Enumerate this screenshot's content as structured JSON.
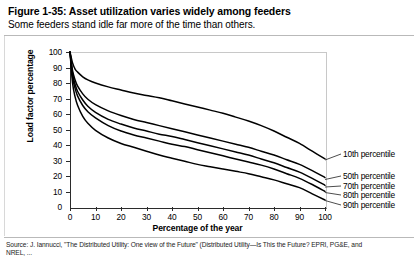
{
  "header": {
    "title": "Figure 1-35: Asset utilization varies widely among feeders",
    "subtitle": "Some feeders stand idle far more of the time than others."
  },
  "source": {
    "line1": "Source: J. Iannucci, \"The Distributed Utility: One view of the Future\" (Distributed Utility—Is This the Future? EPRI, PG&E, and",
    "line2": "NREL, ..."
  },
  "chart_data": {
    "type": "line",
    "title": "Asset utilization varies widely among feeders",
    "xlabel": "Percentage of the year",
    "ylabel": "Load factor percentage",
    "xlim": [
      0,
      100
    ],
    "ylim": [
      0,
      100
    ],
    "xticks": [
      0,
      10,
      20,
      30,
      40,
      50,
      60,
      70,
      80,
      90,
      100
    ],
    "yticks": [
      0,
      10,
      20,
      30,
      40,
      50,
      60,
      70,
      80,
      90,
      100
    ],
    "grid": false,
    "legend_position": "right-inline-leader-labels",
    "x": [
      0,
      1,
      2,
      3,
      5,
      7,
      10,
      15,
      20,
      25,
      30,
      35,
      40,
      45,
      50,
      55,
      60,
      65,
      70,
      75,
      80,
      85,
      90,
      95,
      100
    ],
    "series": [
      {
        "name": "10th percentile",
        "values": [
          100,
          93,
          89,
          87,
          84,
          82,
          80,
          77.5,
          75.5,
          73.5,
          72,
          70.5,
          68.5,
          66.5,
          64.5,
          62.5,
          60.5,
          58,
          55.5,
          52.5,
          49,
          45,
          41,
          36,
          31
        ]
      },
      {
        "name": "50th percentile",
        "values": [
          100,
          88,
          82,
          78,
          73,
          69.5,
          66,
          62,
          59,
          56.5,
          54.5,
          52.5,
          50.5,
          48.5,
          46.5,
          44.5,
          42.5,
          40.5,
          38.5,
          36,
          33.5,
          30.5,
          27.5,
          23.5,
          19
        ]
      },
      {
        "name": "70th percentile",
        "values": [
          100,
          86,
          79,
          74.5,
          69,
          65,
          61,
          56.5,
          53.5,
          51,
          49,
          47,
          45.5,
          43.5,
          41.5,
          39.5,
          37.5,
          35.5,
          33.5,
          31,
          28.5,
          25.5,
          22.5,
          18.5,
          14
        ]
      },
      {
        "name": "80th percentile",
        "values": [
          100,
          84,
          76.5,
          71.5,
          65.5,
          61.5,
          57.5,
          52.5,
          49,
          46.5,
          44.5,
          42.5,
          40.5,
          39,
          37,
          35,
          33,
          31,
          29,
          27,
          24.5,
          21.5,
          18.5,
          14.5,
          10
        ]
      },
      {
        "name": "90th percentile",
        "values": [
          100,
          80,
          71,
          65.5,
          58.5,
          54,
          49.5,
          44.5,
          41,
          38.5,
          36,
          33.5,
          31.5,
          29.5,
          27.5,
          26,
          24.5,
          23,
          21.5,
          19.5,
          17.5,
          15,
          12.5,
          8.5,
          4.5
        ]
      }
    ]
  },
  "labels": {
    "series_labels": [
      "10th percentile",
      "50th percentile",
      "70th percentile",
      "80th percentile",
      "90th percentile"
    ]
  }
}
